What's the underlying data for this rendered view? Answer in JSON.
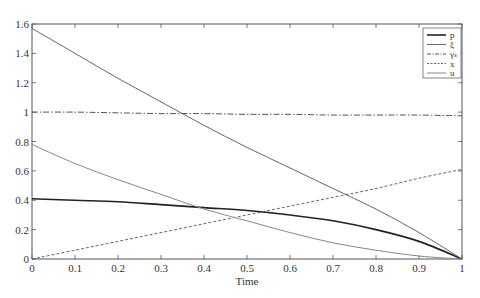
{
  "chart_data": {
    "type": "line",
    "title": "",
    "xlabel": "Time",
    "ylabel": "",
    "xlim": [
      0,
      1
    ],
    "ylim": [
      0,
      1.6
    ],
    "grid": false,
    "legend_position": "upper right",
    "x": [
      0,
      0.1,
      0.2,
      0.3,
      0.4,
      0.5,
      0.6,
      0.7,
      0.8,
      0.9,
      1.0
    ],
    "xticks": [
      "0",
      "0.1",
      "0.2",
      "0.3",
      "0.4",
      "0.5",
      "0.6",
      "0.7",
      "0.8",
      "0.9",
      "1"
    ],
    "yticks": [
      "0",
      "0.2",
      "0.4",
      "0.6",
      "0.8",
      "1",
      "1.2",
      "1.4",
      "1.6"
    ],
    "series": [
      {
        "name": "p",
        "style": "solid-thick",
        "color": "#222222",
        "values": [
          0.41,
          0.4,
          0.39,
          0.37,
          0.35,
          0.33,
          0.3,
          0.26,
          0.2,
          0.12,
          0.0
        ]
      },
      {
        "name": "ξ",
        "style": "solid",
        "color": "#666666",
        "values": [
          1.57,
          1.4,
          1.23,
          1.07,
          0.91,
          0.76,
          0.62,
          0.48,
          0.34,
          0.18,
          0.0
        ]
      },
      {
        "name": "γₛ",
        "style": "dash-dot",
        "color": "#555555",
        "values": [
          1.0,
          1.0,
          0.995,
          0.99,
          0.99,
          0.985,
          0.985,
          0.98,
          0.98,
          0.98,
          0.975
        ]
      },
      {
        "name": "x",
        "style": "dashed",
        "color": "#555555",
        "values": [
          0.0,
          0.06,
          0.12,
          0.18,
          0.24,
          0.3,
          0.36,
          0.42,
          0.48,
          0.55,
          0.61
        ]
      },
      {
        "name": "u",
        "style": "solid-thin",
        "color": "#888888",
        "values": [
          0.78,
          0.65,
          0.54,
          0.44,
          0.34,
          0.26,
          0.18,
          0.11,
          0.06,
          0.02,
          0.0
        ]
      }
    ]
  }
}
